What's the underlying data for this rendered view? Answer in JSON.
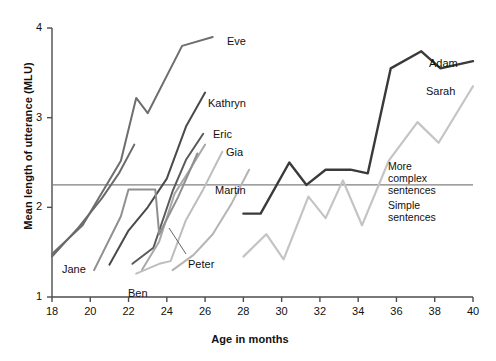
{
  "chart_data": {
    "type": "line",
    "title": "",
    "xlabel": "Age in months",
    "ylabel": "Mean length of utterance (MLU)",
    "xlim": [
      18,
      40
    ],
    "ylim": [
      1,
      4
    ],
    "xticks": [
      18,
      20,
      22,
      24,
      26,
      28,
      30,
      32,
      34,
      36,
      38,
      40
    ],
    "yticks": [
      1,
      2,
      3,
      4
    ],
    "grid": false,
    "legend_position": "inline-end-of-line",
    "annotations": [
      {
        "name": "complex-zone",
        "text": "More complex sentences",
        "y": 2.25,
        "position": "above-divider"
      },
      {
        "name": "simple-zone",
        "text": "Simple sentences",
        "y": 2.25,
        "position": "below-divider"
      }
    ],
    "divider_y": 2.25,
    "series": [
      {
        "name": "Eve",
        "color": "#6e6e6e",
        "width": 2.0,
        "x": [
          18.0,
          19.6,
          21.6,
          22.4,
          23.0,
          24.8,
          26.4
        ],
        "y": [
          1.48,
          1.8,
          2.52,
          3.22,
          3.05,
          3.8,
          3.9
        ]
      },
      {
        "name": "Kathryn",
        "color": "#4a4a4a",
        "width": 2.0,
        "x": [
          21.0,
          22.0,
          23.0,
          24.0,
          25.0,
          26.0
        ],
        "y": [
          1.36,
          1.74,
          2.0,
          2.32,
          2.9,
          3.28
        ]
      },
      {
        "name": "Eric",
        "color": "#5a5a5a",
        "width": 2.0,
        "x": [
          22.2,
          23.3,
          24.3,
          25.0,
          25.9
        ],
        "y": [
          1.37,
          1.55,
          2.18,
          2.53,
          2.82
        ]
      },
      {
        "name": "Gia",
        "color": "#a8a8a8",
        "width": 2.0,
        "x": [
          22.7,
          23.6,
          24.4,
          25.2,
          26.0
        ],
        "y": [
          1.3,
          1.62,
          2.15,
          2.42,
          2.7
        ]
      },
      {
        "name": "Jane",
        "color": "#6a6a6a",
        "width": 2.0,
        "x": [
          18.0,
          19.4,
          20.6,
          21.5,
          22.3
        ],
        "y": [
          1.45,
          1.78,
          2.1,
          2.38,
          2.7
        ]
      },
      {
        "name": "Ben",
        "color": "#8f8f8f",
        "width": 2.0,
        "x": [
          20.2,
          21.6,
          22.0,
          23.4,
          23.6,
          24.6,
          25.6
        ],
        "y": [
          1.3,
          1.9,
          2.2,
          2.2,
          1.7,
          2.12,
          2.6
        ]
      },
      {
        "name": "Peter",
        "color": "#bdbdbd",
        "width": 2.0,
        "x": [
          22.4,
          23.6,
          24.2,
          25.0,
          25.9,
          26.9
        ],
        "y": [
          1.26,
          1.37,
          1.4,
          1.86,
          2.2,
          2.62
        ]
      },
      {
        "name": "Martin",
        "color": "#b4b4b4",
        "width": 2.0,
        "x": [
          24.3,
          25.4,
          26.4,
          27.4,
          28.3
        ],
        "y": [
          1.3,
          1.47,
          1.7,
          2.05,
          2.42
        ]
      },
      {
        "name": "Adam",
        "color": "#3a3a3a",
        "width": 2.4,
        "x": [
          28.0,
          28.9,
          30.4,
          31.3,
          32.3,
          33.6,
          34.5,
          35.7,
          37.3,
          38.3,
          40.0
        ],
        "y": [
          1.93,
          1.93,
          2.5,
          2.25,
          2.42,
          2.42,
          2.38,
          3.55,
          3.74,
          3.55,
          3.63
        ]
      },
      {
        "name": "Sarah",
        "color": "#c4c4c4",
        "width": 2.2,
        "x": [
          28.0,
          29.2,
          30.1,
          31.4,
          32.3,
          33.2,
          34.2,
          35.6,
          37.1,
          38.2,
          40.0
        ],
        "y": [
          1.45,
          1.7,
          1.42,
          2.12,
          1.88,
          2.3,
          1.8,
          2.52,
          2.95,
          2.72,
          3.35
        ]
      }
    ],
    "series_labels": [
      {
        "name": "Eve",
        "x_px": 227,
        "y_px": 35
      },
      {
        "name": "Kathryn",
        "x_px": 208,
        "y_px": 97
      },
      {
        "name": "Eric",
        "x_px": 213,
        "y_px": 128
      },
      {
        "name": "Gia",
        "x_px": 226,
        "y_px": 146
      },
      {
        "name": "Martin",
        "x_px": 215,
        "y_px": 184
      },
      {
        "name": "Jane",
        "x_px": 62,
        "y_px": 263
      },
      {
        "name": "Ben",
        "x_px": 128,
        "y_px": 287
      },
      {
        "name": "Peter",
        "x_px": 188,
        "y_px": 258
      },
      {
        "name": "Adam",
        "x_px": 429,
        "y_px": 57
      },
      {
        "name": "Sarah",
        "x_px": 426,
        "y_px": 85
      }
    ]
  },
  "axis": {
    "y_title": "Mean length of utterance (MLU)",
    "x_title": "Age in months",
    "y_tick_labels": [
      "4",
      "3",
      "2",
      "1"
    ],
    "x_tick_labels": [
      "18",
      "20",
      "22",
      "24",
      "26",
      "28",
      "30",
      "32",
      "34",
      "36",
      "38",
      "40"
    ]
  },
  "zones": {
    "complex_line1": "More",
    "complex_line2": "complex",
    "complex_line3": "sentences",
    "simple_line1": "Simple",
    "simple_line2": "sentences"
  },
  "colors": {
    "axis": "#4d4d4d",
    "text": "#111111",
    "divider": "#808080",
    "background": "#ffffff"
  }
}
